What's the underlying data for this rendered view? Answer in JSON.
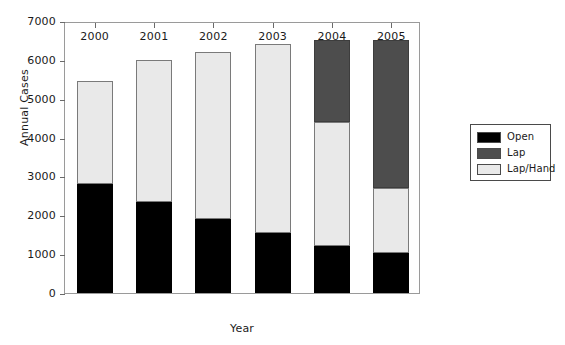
{
  "chart_data": {
    "type": "bar",
    "subtype": "stacked-bar",
    "title": "",
    "xlabel": "Year",
    "ylabel": "Annual Cases",
    "categories": [
      "2000",
      "2001",
      "2002",
      "2003",
      "2004",
      "2005"
    ],
    "ylim": [
      0,
      7000
    ],
    "ytick_labels": [
      "0",
      "1000",
      "2000",
      "3000",
      "4000",
      "5000",
      "6000",
      "7000"
    ],
    "ytick_values": [
      0,
      1000,
      2000,
      3000,
      4000,
      5000,
      6000,
      7000
    ],
    "grid": false,
    "legend_position": "right-outside",
    "series": [
      {
        "name": "Open",
        "color": "#000000",
        "values": [
          2800,
          2350,
          1900,
          1550,
          1200,
          1020
        ]
      },
      {
        "name": "Lap",
        "color": "#4d4d4d",
        "values": [
          0,
          0,
          0,
          0,
          2100,
          3800
        ]
      },
      {
        "name": "Lap/Hand",
        "color": "#e9e9e9",
        "values": [
          2650,
          3650,
          4300,
          4850,
          3200,
          1680
        ]
      }
    ],
    "stack_order": [
      "Open",
      "Lap/Hand",
      "Lap"
    ],
    "totals": [
      5450,
      6000,
      6200,
      6400,
      6500,
      6500
    ]
  },
  "legend": {
    "entries": [
      {
        "label": "Open",
        "swatch": "black-swatch"
      },
      {
        "label": "Lap",
        "swatch": "dark-gray-swatch"
      },
      {
        "label": "Lap/Hand",
        "swatch": "white-swatch"
      }
    ]
  }
}
